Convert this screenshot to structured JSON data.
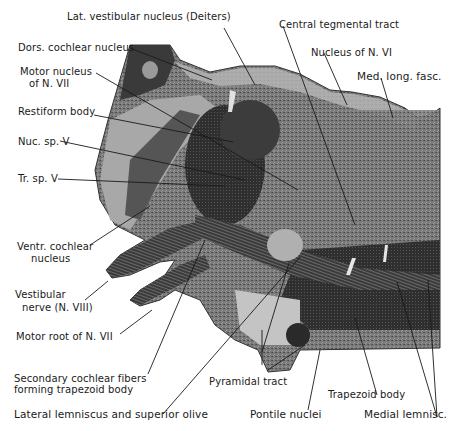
{
  "figure": {
    "colors": {
      "background": "#ffffff",
      "tissue_light": "#c9c9c9",
      "tissue_mid": "#8a8a8a",
      "tissue_dark": "#2e2e2e",
      "outline": "#333333",
      "text": "#1a1a1a"
    }
  },
  "labels": {
    "lat_vestibular": "Lat. vestibular nucleus (Deiters)",
    "central_tegmental": "Central tegmental tract",
    "dors_cochlear": "Dors. cochlear nucleus",
    "nucleus_n6": "Nucleus of N. VI",
    "motor_nucleus_line1": "Motor nucleus",
    "motor_nucleus_line2": "of N. VII",
    "med_long_fasc": "Med. long. fasc.",
    "restiform": "Restiform body",
    "nuc_sp_v": "Nuc. sp. V",
    "tr_sp_v": "Tr. sp. V",
    "ventr_cochlear_line1": "Ventr. cochlear",
    "ventr_cochlear_line2": "nucleus",
    "vestibular_nerve_line1": "Vestibular",
    "vestibular_nerve_line2": "nerve (N. VIII)",
    "motor_root": "Motor root of N. VII",
    "secondary_cochlear_line1": "Secondary cochlear fibers",
    "secondary_cochlear_line2": "forming trapezoid body",
    "pyramidal": "Pyramidal tract",
    "trapezoid": "Trapezoid body",
    "lateral_lemniscus": "Lateral lemniscus and superior olive",
    "pontile": "Pontile nuclei",
    "medial_lemnisc": "Medial lemnisc."
  }
}
